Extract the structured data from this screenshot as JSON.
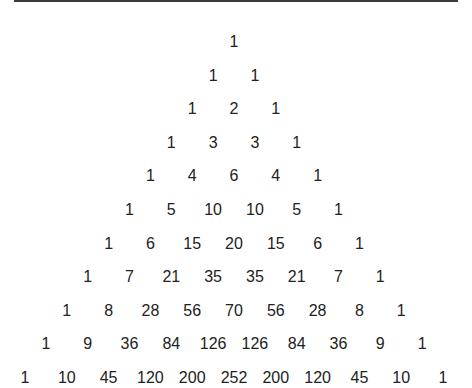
{
  "figure": {
    "rows": [
      [
        "1"
      ],
      [
        "1",
        "1"
      ],
      [
        "1",
        "2",
        "1"
      ],
      [
        "1",
        "3",
        "3",
        "1"
      ],
      [
        "1",
        "4",
        "6",
        "4",
        "1"
      ],
      [
        "1",
        "5",
        "10",
        "10",
        "5",
        "1"
      ],
      [
        "1",
        "6",
        "15",
        "20",
        "15",
        "6",
        "1"
      ],
      [
        "1",
        "7",
        "21",
        "35",
        "35",
        "21",
        "7",
        "1"
      ],
      [
        "1",
        "8",
        "28",
        "56",
        "70",
        "56",
        "28",
        "8",
        "1"
      ],
      [
        "1",
        "9",
        "36",
        "84",
        "126",
        "126",
        "84",
        "36",
        "9",
        "1"
      ],
      [
        "1",
        "10",
        "45",
        "120",
        "200",
        "252",
        "200",
        "120",
        "45",
        "10",
        "1"
      ]
    ]
  },
  "layout": {
    "center_x": 234,
    "first_row_y": 42,
    "row_step": 33.6,
    "col_step": 41.8
  }
}
